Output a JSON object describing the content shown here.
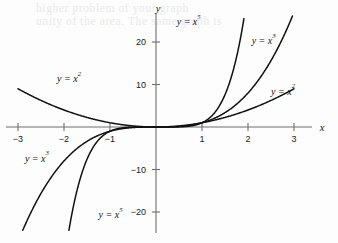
{
  "figure": {
    "background_color": "#fdfdfd",
    "ink_color": "#111111",
    "axis_color": "#6e6e6e",
    "bleed_text_line1": "higher problem of your graph",
    "bleed_text_line2": "unity of the area. The same graph is"
  },
  "axes": {
    "x_name": "x",
    "y_name": "y"
  },
  "chart_data": {
    "type": "line",
    "title": "",
    "xlabel": "x",
    "ylabel": "y",
    "grid": false,
    "legend": "inline-curve-labels",
    "xlim": [
      -3.0,
      3.0
    ],
    "ylim": [
      -26.0,
      26.0
    ],
    "xticks": [
      -3,
      -2,
      -1,
      1,
      2,
      3
    ],
    "xtick_labels": [
      "−3",
      "−2",
      "−1",
      "1",
      "2",
      "3"
    ],
    "yticks": [
      20,
      10,
      -10,
      -20
    ],
    "ytick_labels": [
      "20",
      "10",
      "−10",
      "−20"
    ],
    "series": [
      {
        "name": "y = x^2",
        "label_text": "y = x",
        "label_exponent": "2",
        "exponent": 2,
        "x": [
          -3.0,
          -2.5,
          -2.0,
          -1.5,
          -1.0,
          -0.5,
          0.0,
          0.5,
          1.0,
          1.5,
          2.0,
          2.5,
          3.0
        ],
        "values": [
          9.0,
          6.25,
          4.0,
          2.25,
          1.0,
          0.25,
          0.0,
          0.25,
          1.0,
          2.25,
          4.0,
          6.25,
          9.0
        ]
      },
      {
        "name": "y = x^3",
        "label_text": "y = x",
        "label_exponent": "3",
        "exponent": 3,
        "x": [
          -2.96,
          -2.5,
          -2.0,
          -1.5,
          -1.0,
          -0.5,
          0.0,
          0.5,
          1.0,
          1.5,
          2.0,
          2.5,
          2.96
        ],
        "values": [
          -25.9,
          -15.63,
          -8.0,
          -3.38,
          -1.0,
          -0.13,
          0.0,
          0.13,
          1.0,
          3.38,
          8.0,
          15.63,
          25.9
        ]
      },
      {
        "name": "y = x^5",
        "label_text": "y = x",
        "label_exponent": "5",
        "exponent": 5,
        "x": [
          -1.92,
          -1.75,
          -1.5,
          -1.25,
          -1.0,
          -0.5,
          0.0,
          0.5,
          1.0,
          1.25,
          1.5,
          1.75,
          1.92
        ],
        "values": [
          -26.1,
          -16.41,
          -7.59,
          -3.05,
          -1.0,
          -0.03,
          0.0,
          0.03,
          1.0,
          3.05,
          7.59,
          16.41,
          26.1
        ]
      }
    ],
    "annotations": [
      {
        "text": "y = x",
        "exponent": "2",
        "x": -2.15,
        "y": 10.6,
        "series": "y = x^2"
      },
      {
        "text": "y = x",
        "exponent": "3",
        "x": -2.85,
        "y": -8.2,
        "series": "y = x^3"
      },
      {
        "text": "y = x",
        "exponent": "5",
        "x": -1.25,
        "y": -21.5,
        "series": "y = x^5"
      },
      {
        "text": "y = x",
        "exponent": "5",
        "x": 0.45,
        "y": 24.0,
        "series": "y = x^5"
      },
      {
        "text": "y = x",
        "exponent": "3",
        "x": 2.08,
        "y": 19.5,
        "series": "y = x^3"
      },
      {
        "text": "y = x",
        "exponent": "2",
        "x": 2.5,
        "y": 7.6,
        "series": "y = x^2"
      }
    ]
  }
}
